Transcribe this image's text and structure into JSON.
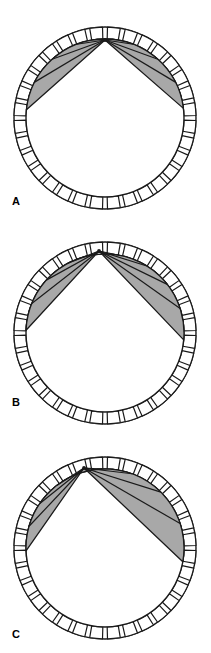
{
  "figure": {
    "background_color": "#ffffff",
    "line_color": "#1a1a1a",
    "fan_fill_color": "#a8a8a8",
    "ring_fill_color": "#ffffff",
    "ring_segment_count": 32,
    "panels": [
      {
        "id": "panel-a",
        "label": "A",
        "label_position": {
          "x": 12,
          "y": 196
        },
        "circle": {
          "cx": 105,
          "cy": 118,
          "outer_r": 91,
          "inner_r": 79
        },
        "apex": {
          "x": 105,
          "y": 40
        },
        "fan_start_angle_deg": 186,
        "fan_end_angle_deg": 353,
        "ray_count": 8,
        "ray_angles_deg": [
          186,
          207,
          228,
          249,
          270,
          291,
          312,
          333,
          353
        ]
      },
      {
        "id": "panel-b",
        "label": "B",
        "label_position": {
          "x": 12,
          "y": 412
        },
        "circle": {
          "cx": 105,
          "cy": 333,
          "outer_r": 91,
          "inner_r": 79
        },
        "apex": {
          "x": 99,
          "y": 251
        },
        "fan_start_angle_deg": 182,
        "fan_end_angle_deg": 5,
        "ray_count": 9,
        "ray_angles_deg": [
          182,
          202,
          222,
          242,
          262,
          282,
          302,
          322,
          342,
          5
        ]
      },
      {
        "id": "panel-c",
        "label": "C",
        "label_position": {
          "x": 12,
          "y": 629
        },
        "circle": {
          "cx": 105,
          "cy": 548,
          "outer_r": 91,
          "inner_r": 79
        },
        "apex": {
          "x": 84,
          "y": 468
        },
        "fan_start_angle_deg": 178,
        "fan_end_angle_deg": 10,
        "ray_count": 9,
        "ray_angles_deg": [
          178,
          196,
          214,
          232,
          250,
          268,
          290,
          315,
          342,
          10
        ]
      }
    ]
  }
}
